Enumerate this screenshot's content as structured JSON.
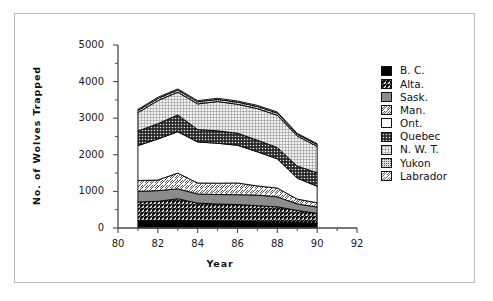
{
  "chart_data": {
    "type": "area",
    "title": "",
    "xlabel": "Year",
    "ylabel": "No. of Wolves Trapped",
    "xlim": [
      80,
      92
    ],
    "ylim": [
      0,
      5000
    ],
    "xticks": [
      "80",
      "82",
      "84",
      "86",
      "88",
      "90",
      "92"
    ],
    "xtick_values": [
      80,
      82,
      84,
      86,
      88,
      90,
      92
    ],
    "yticks": [
      "0",
      "1000",
      "2000",
      "3000",
      "4000",
      "5000"
    ],
    "ytick_values": [
      0,
      1000,
      2000,
      3000,
      4000,
      5000
    ],
    "minor_ticks": true,
    "grid": false,
    "stacked": true,
    "legend_position": "right",
    "x": [
      81,
      82,
      83,
      84,
      85,
      86,
      87,
      88,
      89,
      90
    ],
    "series": [
      {
        "name": "B. C.",
        "pattern": "solid-black",
        "color": "#000000",
        "values": [
          200,
          200,
          210,
          190,
          185,
          180,
          170,
          160,
          150,
          140
        ]
      },
      {
        "name": "Alta.",
        "pattern": "diagonal-hatch-dark",
        "color": "#262626",
        "values": [
          510,
          530,
          590,
          490,
          470,
          460,
          440,
          420,
          330,
          260
        ]
      },
      {
        "name": "Sask.",
        "pattern": "solid-gray",
        "color": "#8c8c8c",
        "values": [
          290,
          290,
          270,
          250,
          260,
          270,
          290,
          270,
          180,
          170
        ]
      },
      {
        "name": "Man.",
        "pattern": "diagonal-hatch-light",
        "color": "#d9d9d9",
        "values": [
          300,
          290,
          430,
          300,
          310,
          320,
          250,
          240,
          130,
          120
        ]
      },
      {
        "name": "Ont.",
        "pattern": "solid-white",
        "color": "#ffffff",
        "values": [
          950,
          1120,
          1130,
          1120,
          1090,
          1030,
          930,
          800,
          570,
          450
        ]
      },
      {
        "name": "Quebec",
        "pattern": "cross-hatch-dark",
        "color": "#333333",
        "values": [
          400,
          420,
          460,
          340,
          340,
          330,
          320,
          310,
          330,
          370
        ]
      },
      {
        "name": "N. W. T.",
        "pattern": "fine-dot-light",
        "color": "#e0e0e0",
        "values": [
          500,
          630,
          620,
          700,
          800,
          790,
          860,
          880,
          820,
          720
        ]
      },
      {
        "name": "Yukon",
        "pattern": "dense-dot-gray",
        "color": "#b0b0b0",
        "values": [
          60,
          60,
          60,
          60,
          60,
          60,
          60,
          60,
          50,
          50
        ]
      },
      {
        "name": "Labrador",
        "pattern": "diagonal-hatch-sparse",
        "color": "#f0f0f0",
        "values": [
          30,
          30,
          30,
          30,
          30,
          30,
          30,
          30,
          25,
          25
        ]
      }
    ],
    "totals": [
      3240,
      3570,
      3800,
      3480,
      3545,
      3470,
      3350,
      3140,
      2585,
      2305
    ]
  },
  "legend": {
    "items": [
      {
        "label": "B. C."
      },
      {
        "label": "Alta."
      },
      {
        "label": "Sask."
      },
      {
        "label": "Man."
      },
      {
        "label": "Ont."
      },
      {
        "label": "Quebec"
      },
      {
        "label": "N. W. T."
      },
      {
        "label": "Yukon"
      },
      {
        "label": "Labrador"
      }
    ]
  }
}
